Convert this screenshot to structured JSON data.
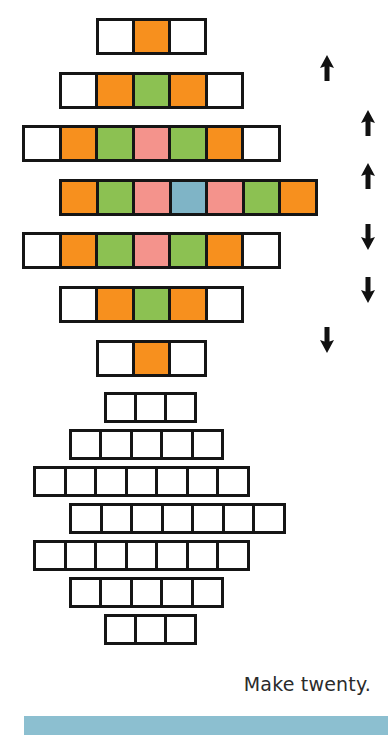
{
  "page": {
    "caption": "Make twenty.",
    "background_color": "#ffffff"
  },
  "palette": {
    "white": "#ffffff",
    "orange": "#f7901e",
    "green": "#8cc152",
    "pink": "#f4938c",
    "blue": "#7fb4c6",
    "outline": "#151515",
    "band": "#8cbfd0",
    "caption_color": "#2b2b2b"
  },
  "stack_figure": {
    "description": "Seven horizontal strips of unit squares, stacked to form a symmetric diamond of colours",
    "cell_size_px": 37,
    "rows": [
      {
        "index": 1,
        "count": 3,
        "left": 96,
        "top": 18,
        "colors": [
          "white",
          "orange",
          "white"
        ]
      },
      {
        "index": 2,
        "count": 5,
        "left": 59,
        "top": 72,
        "colors": [
          "white",
          "orange",
          "green",
          "orange",
          "white"
        ]
      },
      {
        "index": 3,
        "count": 7,
        "left": 22,
        "top": 125,
        "colors": [
          "white",
          "orange",
          "green",
          "pink",
          "green",
          "orange",
          "white"
        ]
      },
      {
        "index": 4,
        "count": 7,
        "left": 59,
        "top": 179,
        "colors": [
          "orange",
          "green",
          "pink",
          "blue",
          "pink",
          "green",
          "orange"
        ]
      },
      {
        "index": 5,
        "count": 7,
        "left": 22,
        "top": 232,
        "colors": [
          "white",
          "orange",
          "green",
          "pink",
          "green",
          "orange",
          "white"
        ]
      },
      {
        "index": 6,
        "count": 5,
        "left": 59,
        "top": 286,
        "colors": [
          "white",
          "orange",
          "green",
          "orange",
          "white"
        ]
      },
      {
        "index": 7,
        "count": 3,
        "left": 96,
        "top": 340,
        "colors": [
          "white",
          "orange",
          "white"
        ]
      }
    ]
  },
  "arrows": [
    {
      "name": "arrow-up-1",
      "direction": "up",
      "left": 319,
      "top": 55
    },
    {
      "name": "arrow-up-2",
      "direction": "up",
      "left": 360,
      "top": 110
    },
    {
      "name": "arrow-up-3",
      "direction": "up",
      "left": 360,
      "top": 163
    },
    {
      "name": "arrow-down-1",
      "direction": "down",
      "left": 360,
      "top": 224
    },
    {
      "name": "arrow-down-2",
      "direction": "down",
      "left": 360,
      "top": 277
    },
    {
      "name": "arrow-down-3",
      "direction": "down",
      "left": 319,
      "top": 327
    }
  ],
  "diamond_figure": {
    "description": "The same seven strips overlapped vertically so the coloured squares form a solid diamond",
    "cell_size_px": 31,
    "rows": [
      {
        "index": 1,
        "count": 3,
        "left": 104,
        "top": 0,
        "colors": [
          "white",
          "orange",
          "white"
        ]
      },
      {
        "index": 2,
        "count": 5,
        "left": 69,
        "top": 37,
        "colors": [
          "white",
          "orange",
          "green",
          "orange",
          "white"
        ]
      },
      {
        "index": 3,
        "count": 7,
        "left": 33,
        "top": 74,
        "colors": [
          "white",
          "orange",
          "green",
          "pink",
          "green",
          "orange",
          "white"
        ]
      },
      {
        "index": 4,
        "count": 7,
        "left": 69,
        "top": 111,
        "colors": [
          "orange",
          "green",
          "pink",
          "blue",
          "pink",
          "green",
          "orange"
        ]
      },
      {
        "index": 5,
        "count": 7,
        "left": 33,
        "top": 148,
        "colors": [
          "white",
          "orange",
          "green",
          "pink",
          "green",
          "orange",
          "white"
        ]
      },
      {
        "index": 6,
        "count": 5,
        "left": 69,
        "top": 185,
        "colors": [
          "white",
          "orange",
          "green",
          "orange",
          "white"
        ]
      },
      {
        "index": 7,
        "count": 3,
        "left": 104,
        "top": 222,
        "colors": [
          "white",
          "orange",
          "white"
        ]
      }
    ]
  },
  "bottom_band": {
    "color": "#8cbfd0",
    "left": 24,
    "top": 716,
    "width": 364,
    "height": 19
  }
}
